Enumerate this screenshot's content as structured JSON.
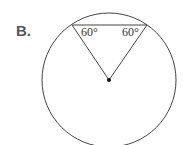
{
  "option_label": "B.",
  "diagram": {
    "circle": {
      "cx": 109,
      "cy": 80,
      "r": 67
    },
    "chord": {
      "x1": 72,
      "y1": 25,
      "x2": 147,
      "y2": 25
    },
    "center_point": {
      "x": 109,
      "y": 80
    },
    "angles": [
      {
        "label": "60°",
        "x": 81,
        "y": 36
      },
      {
        "label": "60°",
        "x": 122,
        "y": 36
      }
    ],
    "stroke_color": "#444444"
  }
}
